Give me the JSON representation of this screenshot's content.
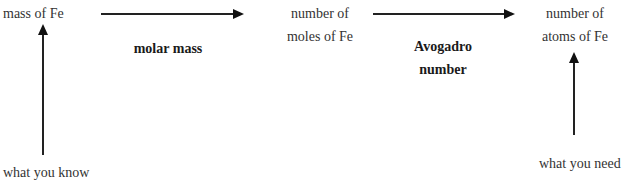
{
  "diagram": {
    "nodes": {
      "start": {
        "label": "mass of Fe"
      },
      "middle": {
        "line1": "number of",
        "line2": "moles of Fe"
      },
      "end": {
        "line1": "number of",
        "line2": "atoms of Fe"
      }
    },
    "edges": [
      {
        "from": "mass of Fe",
        "to": "number of moles of Fe",
        "label": "molar mass"
      },
      {
        "from": "number of moles of Fe",
        "to": "number of atoms of Fe",
        "label_line1": "Avogadro",
        "label_line2": "number"
      }
    ],
    "annotations": {
      "known": {
        "label": "what you know",
        "points_to": "mass of Fe"
      },
      "needed": {
        "label": "what you need",
        "points_to": "number of atoms of Fe"
      }
    }
  }
}
